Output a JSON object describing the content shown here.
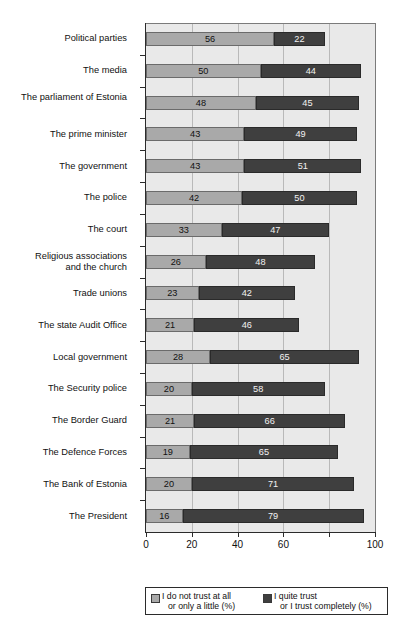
{
  "chart_data": {
    "type": "bar",
    "orientation": "horizontal",
    "stacked": true,
    "title": "",
    "xlabel": "",
    "ylabel": "",
    "xlim": [
      0,
      100
    ],
    "xticks": [
      0,
      20,
      40,
      60,
      80,
      100
    ],
    "xtick_labels": [
      "0",
      "20",
      "40",
      "60",
      "80",
      "100"
    ],
    "xtick_labels_visible": [
      "0",
      "20",
      "40",
      "60",
      "",
      "100"
    ],
    "grid": "vertical",
    "legend_position": "bottom",
    "categories": [
      "Political parties",
      "The media",
      "The parliament of Estonia",
      "The prime minister",
      "The government",
      "The police",
      "The court",
      "Religious associations and the church",
      "Trade unions",
      "The state Audit Office",
      "Local government",
      "The Security police",
      "The Border Guard",
      "The Defence Forces",
      "The Bank of Estonia",
      "The President"
    ],
    "series": [
      {
        "name": "I do not trust at all or only a little (%)",
        "color": "#a9a9a9",
        "values": [
          56,
          50,
          48,
          43,
          43,
          42,
          33,
          26,
          23,
          21,
          28,
          20,
          21,
          19,
          20,
          16
        ]
      },
      {
        "name": "I quite trust or I trust completely (%)",
        "color": "#3f3f3f",
        "values": [
          22,
          44,
          45,
          49,
          51,
          50,
          47,
          48,
          42,
          46,
          65,
          58,
          66,
          65,
          71,
          79
        ]
      }
    ]
  },
  "legend": {
    "items": [
      {
        "icon": "legend-swatch-light",
        "line1": "I do not trust at all",
        "line2": "or only a little (%)"
      },
      {
        "icon": "legend-swatch-dark",
        "line1": "I quite trust",
        "line2": "or I trust completely (%)"
      }
    ]
  },
  "colors": {
    "low_trust": "#a9a9a9",
    "high_trust": "#3f3f3f",
    "plot_background": "#e9e9e9",
    "gridline": "#b9b9b9",
    "axis": "#2b2b2b"
  }
}
